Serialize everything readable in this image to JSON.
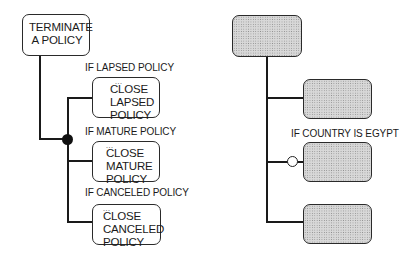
{
  "left_diagram": {
    "root": {
      "lines": [
        "TERMINATE",
        "A POLICY"
      ]
    },
    "branches": [
      {
        "condition": "IF LAPSED POLICY",
        "ellipsis": "...",
        "lines": [
          "CLOSE",
          "LAPSED",
          "POLICY"
        ]
      },
      {
        "condition": "IF MATURE POLICY",
        "ellipsis": "...",
        "lines": [
          "CLOSE",
          "MATURE",
          "POLICY"
        ]
      },
      {
        "condition": "IF CANCELED POLICY",
        "ellipsis": "...",
        "lines": [
          "CLOSE",
          "CANCELED",
          "POLICY"
        ]
      }
    ],
    "junction": "filled-circle"
  },
  "right_diagram": {
    "root": {
      "shaded": true
    },
    "branches": [
      {
        "condition": "",
        "shaded": true
      },
      {
        "condition": "IF COUNTRY IS EGYPT",
        "shaded": true,
        "connector": "open-circle"
      },
      {
        "condition": "",
        "shaded": true
      }
    ]
  }
}
